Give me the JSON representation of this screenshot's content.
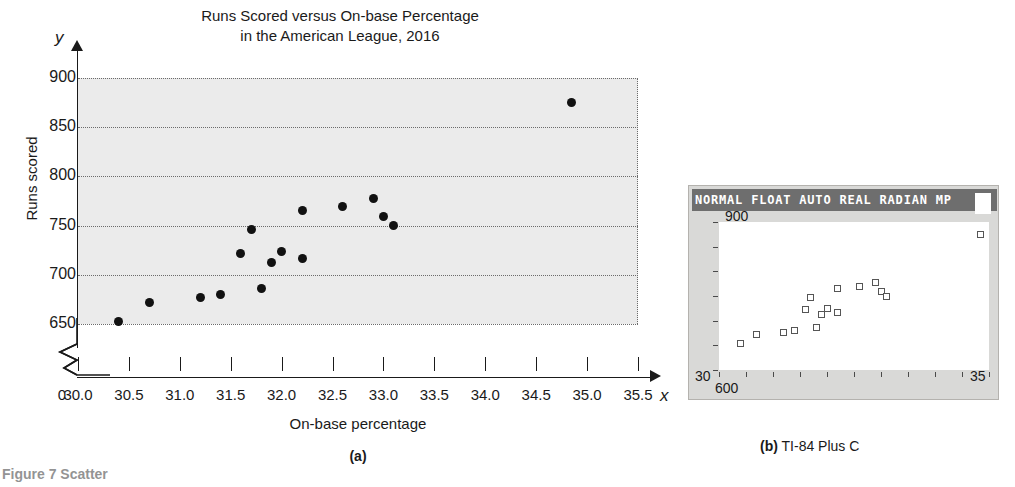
{
  "figure": {
    "label": "Figure 7 Scatter",
    "caption_a": "(a)",
    "caption_b_marker": "(b)",
    "caption_b_text": "TI-84 Plus C"
  },
  "chart_data": {
    "type": "scatter",
    "title": "Runs Scored versus On-base Percentage\nin the American League, 2016",
    "title_line1": "Runs Scored versus On-base Percentage",
    "title_line2": "in the American League, 2016",
    "xlabel": "On-base percentage",
    "ylabel": "Runs scored",
    "x_var": "x",
    "y_var": "y",
    "xlim": [
      30.0,
      35.5
    ],
    "ylim": [
      650,
      900
    ],
    "x_ticks": [
      "30.0",
      "30.5",
      "31.0",
      "31.5",
      "32.0",
      "32.5",
      "33.0",
      "33.5",
      "34.0",
      "34.5",
      "35.0",
      "35.5"
    ],
    "x_tick_values": [
      30.0,
      30.5,
      31.0,
      31.5,
      32.0,
      32.5,
      33.0,
      33.5,
      34.0,
      34.5,
      35.0,
      35.5
    ],
    "y_ticks": [
      "650",
      "700",
      "750",
      "800",
      "850",
      "900"
    ],
    "y_tick_values": [
      650,
      700,
      750,
      800,
      850,
      900
    ],
    "origin_label": "0",
    "axis_break": true,
    "grid": true,
    "legend": "none",
    "points": [
      {
        "x": 30.4,
        "y": 653
      },
      {
        "x": 30.7,
        "y": 672
      },
      {
        "x": 31.2,
        "y": 677
      },
      {
        "x": 31.4,
        "y": 680
      },
      {
        "x": 31.6,
        "y": 722
      },
      {
        "x": 31.7,
        "y": 746
      },
      {
        "x": 31.8,
        "y": 686
      },
      {
        "x": 31.9,
        "y": 713
      },
      {
        "x": 32.0,
        "y": 724
      },
      {
        "x": 32.2,
        "y": 717
      },
      {
        "x": 32.2,
        "y": 765
      },
      {
        "x": 32.6,
        "y": 769
      },
      {
        "x": 32.9,
        "y": 778
      },
      {
        "x": 33.0,
        "y": 759
      },
      {
        "x": 33.1,
        "y": 750
      },
      {
        "x": 34.85,
        "y": 875
      }
    ]
  },
  "calculator": {
    "status_bar": "NORMAL FLOAT AUTO REAL RADIAN MP",
    "battery_icon": "battery-icon",
    "window": {
      "ymax_label": "900",
      "ymin_label": "600",
      "xmin_label": "30",
      "xmax_label": "35"
    },
    "screen_xlim": [
      30,
      35
    ],
    "screen_ylim": [
      600,
      900
    ],
    "marker": "open-square"
  }
}
